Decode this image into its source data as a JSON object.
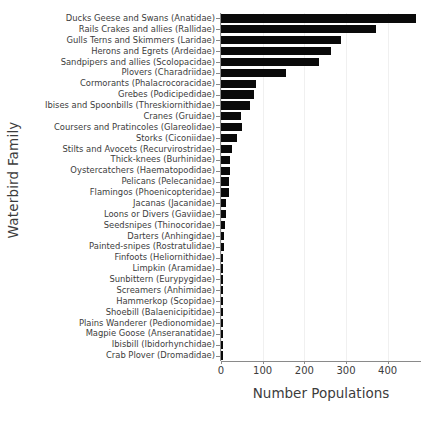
{
  "chart_data": {
    "type": "bar",
    "orientation": "horizontal",
    "title": "",
    "xlabel": "Number Populations",
    "ylabel": "Waterbird Family",
    "xlim": [
      0,
      480
    ],
    "xticks": [
      0,
      100,
      200,
      300,
      400
    ],
    "xtick_labels": [
      "0",
      "100",
      "200",
      "300",
      "400"
    ],
    "grid": "vertical-light",
    "bar_color": "#0a0a0a",
    "legend": null,
    "categories": [
      "Ducks Geese and Swans (Anatidae)",
      "Rails Crakes and allies (Rallidae)",
      "Gulls Terns and Skimmers (Laridae)",
      "Herons and Egrets (Ardeidae)",
      "Sandpipers and allies (Scolopacidae)",
      "Plovers (Charadriidae)",
      "Cormorants (Phalacrocoracidae)",
      "Grebes (Podicipedidae)",
      "Ibises and Spoonbills (Threskiornithidae)",
      "Cranes (Gruidae)",
      "Coursers and Pratincoles (Glareolidae)",
      "Storks (Ciconiidae)",
      "Stilts and Avocets (Recurvirostridae)",
      "Thick-knees (Burhinidae)",
      "Oystercatchers (Haematopodidae)",
      "Pelicans (Pelecanidae)",
      "Flamingos (Phoenicopteridae)",
      "Jacanas (Jacanidae)",
      "Loons or Divers (Gaviidae)",
      "Seedsnipes (Thinocoridae)",
      "Darters (Anhingidae)",
      "Painted-snipes (Rostratulidae)",
      "Finfoots (Heliornithidae)",
      "Limpkin (Aramidae)",
      "Sunbittern (Eurypygidae)",
      "Screamers (Anhimidae)",
      "Hammerkop (Scopidae)",
      "Shoebill (Balaenicipitidae)",
      "Plains Wanderer (Pedionomidae)",
      "Magpie Goose (Anseranatidae)",
      "Ibisbill (Ibidorhynchidae)",
      "Crab Plover (Dromadidae)"
    ],
    "values": [
      468,
      373,
      289,
      264,
      235,
      157,
      84,
      78,
      69,
      47,
      50,
      39,
      27,
      22,
      22,
      20,
      20,
      13,
      11,
      10,
      8,
      7,
      5,
      4,
      4,
      4,
      4,
      3,
      3,
      3,
      3,
      3
    ]
  }
}
